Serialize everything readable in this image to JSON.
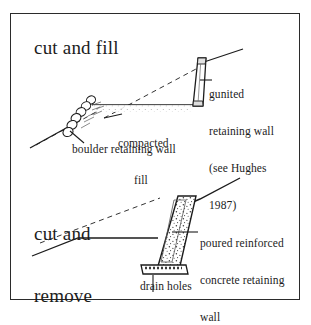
{
  "figure": {
    "frame": {
      "border_color": "#2b2b2b",
      "background_color": "#ffffff"
    },
    "ink_color": "#1c1c1c",
    "panels": [
      {
        "id": "cut-and-fill",
        "title": "cut and fill",
        "labels": [
          {
            "id": "gunited-retaining-wall",
            "lines": [
              "gunited",
              "retaining wall",
              "(see Hughes",
              "1987)"
            ]
          },
          {
            "id": "compacted-fill",
            "lines": [
              "compacted",
              "fill"
            ]
          },
          {
            "id": "boulder-retaining-wall",
            "lines": [
              "boulder retaining wall"
            ]
          }
        ]
      },
      {
        "id": "cut-and-remove",
        "title_lines": [
          "cut and",
          "remove"
        ],
        "labels": [
          {
            "id": "poured-reinforced-concrete",
            "lines": [
              "poured reinforced",
              "concrete retaining",
              "wall"
            ]
          },
          {
            "id": "drain-holes",
            "lines": [
              "drain holes"
            ]
          }
        ]
      }
    ]
  }
}
